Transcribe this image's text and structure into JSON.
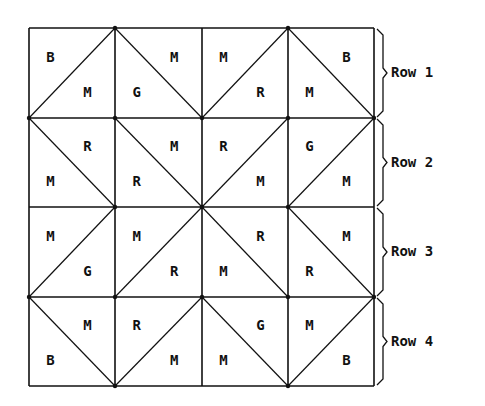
{
  "grid": {
    "x0": 29,
    "y0": 28,
    "col_lines": [
      29,
      115,
      202,
      288,
      374
    ],
    "row_lines": [
      28,
      118,
      207,
      297,
      386
    ],
    "line_color": "#111111"
  },
  "rows": [
    {
      "label": "Row 1",
      "cells": [
        {
          "diagonal": "/",
          "top_letter": "B",
          "bottom_letter": "M"
        },
        {
          "diagonal": "\\",
          "top_letter": "M",
          "bottom_letter": "G"
        },
        {
          "diagonal": "/",
          "top_letter": "M",
          "bottom_letter": "R"
        },
        {
          "diagonal": "\\",
          "top_letter": "B",
          "bottom_letter": "M"
        }
      ]
    },
    {
      "label": "Row 2",
      "cells": [
        {
          "diagonal": "\\",
          "top_letter": "R",
          "bottom_letter": "M"
        },
        {
          "diagonal": "\\",
          "top_letter": "M",
          "bottom_letter": "R"
        },
        {
          "diagonal": "/",
          "top_letter": "R",
          "bottom_letter": "M"
        },
        {
          "diagonal": "/",
          "top_letter": "G",
          "bottom_letter": "M"
        }
      ]
    },
    {
      "label": "Row 3",
      "cells": [
        {
          "diagonal": "/",
          "top_letter": "M",
          "bottom_letter": "G"
        },
        {
          "diagonal": "/",
          "top_letter": "M",
          "bottom_letter": "R"
        },
        {
          "diagonal": "\\",
          "top_letter": "R",
          "bottom_letter": "M"
        },
        {
          "diagonal": "\\",
          "top_letter": "M",
          "bottom_letter": "R"
        }
      ]
    },
    {
      "label": "Row 4",
      "cells": [
        {
          "diagonal": "\\",
          "top_letter": "M",
          "bottom_letter": "B"
        },
        {
          "diagonal": "/",
          "top_letter": "R",
          "bottom_letter": "M"
        },
        {
          "diagonal": "\\",
          "top_letter": "G",
          "bottom_letter": "M"
        },
        {
          "diagonal": "/",
          "top_letter": "M",
          "bottom_letter": "B"
        }
      ]
    }
  ],
  "legend_note": "Letters: B, M, G, R mark fabric color in each triangle"
}
